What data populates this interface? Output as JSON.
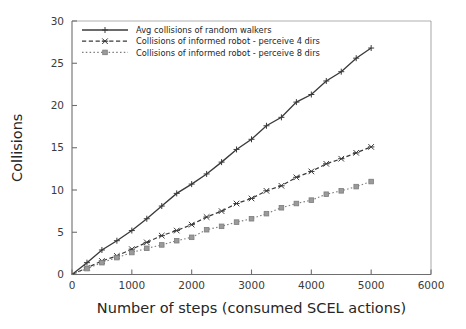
{
  "figure": {
    "background_color": "#ffffff",
    "axis_color": "#6e6e6e",
    "text_color": "#262626"
  },
  "chart_data": {
    "type": "line",
    "title": "",
    "xlabel": "Number of steps (consumed SCEL actions)",
    "ylabel": "Collisions",
    "xlim": [
      0,
      6000
    ],
    "ylim": [
      0,
      30
    ],
    "xticks": [
      0,
      1000,
      2000,
      3000,
      4000,
      5000,
      6000
    ],
    "xticklabels": [
      "0",
      "1000",
      "2000",
      "3000",
      "4000",
      "5000",
      "6000"
    ],
    "yticks": [
      0,
      5,
      10,
      15,
      20,
      25,
      30
    ],
    "yticklabels": [
      "0",
      "5",
      "10",
      "15",
      "20",
      "25",
      "30"
    ],
    "grid": false,
    "legend_position": "upper left",
    "series": [
      {
        "name": "Avg collisions of random walkers",
        "linestyle": "solid",
        "marker": "plus",
        "color": "#3a3a3a",
        "x": [
          0,
          250,
          500,
          750,
          1000,
          1250,
          1500,
          1750,
          2000,
          2250,
          2500,
          2750,
          3000,
          3250,
          3500,
          3750,
          4000,
          4250,
          4500,
          4750,
          5000
        ],
        "values": [
          0.0,
          1.4,
          2.9,
          4.0,
          5.2,
          6.6,
          8.1,
          9.6,
          10.7,
          11.9,
          13.3,
          14.8,
          16.0,
          17.6,
          18.6,
          20.4,
          21.3,
          22.9,
          24.0,
          25.6,
          26.8
        ]
      },
      {
        "name": "Collisions of informed robot - perceive 4 dirs",
        "linestyle": "dashed",
        "marker": "x",
        "color": "#3a3a3a",
        "x": [
          0,
          250,
          500,
          750,
          1000,
          1250,
          1500,
          1750,
          2000,
          2250,
          2500,
          2750,
          3000,
          3250,
          3500,
          3750,
          4000,
          4250,
          4500,
          4750,
          5000
        ],
        "values": [
          0.0,
          0.8,
          1.6,
          2.2,
          3.0,
          3.8,
          4.6,
          5.2,
          5.9,
          6.8,
          7.5,
          8.4,
          9.0,
          9.9,
          10.5,
          11.5,
          12.2,
          13.1,
          13.7,
          14.4,
          15.1
        ]
      },
      {
        "name": "Collisions of informed robot - perceive 8 dirs",
        "linestyle": "dotted",
        "marker": "square",
        "color": "#7d7d7d",
        "x": [
          0,
          250,
          500,
          750,
          1000,
          1250,
          1500,
          1750,
          2000,
          2250,
          2500,
          2750,
          3000,
          3250,
          3500,
          3750,
          4000,
          4250,
          4500,
          4750,
          5000
        ],
        "values": [
          0.0,
          0.7,
          1.4,
          2.0,
          2.6,
          3.1,
          3.5,
          4.0,
          4.4,
          5.3,
          5.7,
          6.2,
          6.6,
          7.2,
          7.9,
          8.4,
          8.8,
          9.5,
          9.9,
          10.4,
          11.0
        ]
      }
    ]
  }
}
